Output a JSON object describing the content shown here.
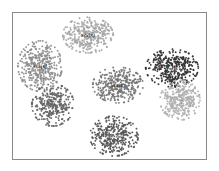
{
  "chart_data": {
    "type": "scatter",
    "title": "",
    "xlabel": "",
    "ylabel": "",
    "grid": false,
    "legend": null,
    "frame": {
      "x": 12,
      "y": 12,
      "width": 195,
      "height": 148,
      "border_color": "#8a8a8a"
    },
    "clusters": [
      {
        "id": "top-center",
        "label": "x(x|s)",
        "label_uncertain": true,
        "cx": 88,
        "cy": 35,
        "rx": 24,
        "ry": 17,
        "color": "#b3b3b3",
        "n": 320,
        "label_dx": 0,
        "label_dy": 0
      },
      {
        "id": "upper-left",
        "label": "x(x|s)",
        "label_uncertain": true,
        "cx": 40,
        "cy": 66,
        "rx": 21,
        "ry": 24,
        "color": "#999999",
        "n": 360,
        "label_dx": 0,
        "label_dy": 0
      },
      {
        "id": "lower-left",
        "label": "?",
        "label_uncertain": true,
        "cx": 53,
        "cy": 105,
        "rx": 20,
        "ry": 20,
        "color": "#6e6e6e",
        "n": 300,
        "label_dx": 2,
        "label_dy": -4
      },
      {
        "id": "center",
        "label": "x(x|s)",
        "label_uncertain": true,
        "cx": 118,
        "cy": 85,
        "rx": 24,
        "ry": 17,
        "color": "#7f7f7f",
        "n": 320,
        "label_dx": 0,
        "label_dy": 0
      },
      {
        "id": "bottom-center",
        "label": "x(x|s)",
        "label_uncertain": true,
        "cx": 114,
        "cy": 136,
        "rx": 23,
        "ry": 19,
        "color": "#5e5e5e",
        "n": 320,
        "label_dx": 0,
        "label_dy": 0
      },
      {
        "id": "upper-right",
        "label": "x(x|s)",
        "label_uncertain": true,
        "cx": 172,
        "cy": 68,
        "rx": 25,
        "ry": 18,
        "color": "#3a3a3a",
        "n": 380,
        "label_dx": 0,
        "label_dy": 0
      },
      {
        "id": "lower-right",
        "label": "?",
        "label_uncertain": true,
        "cx": 180,
        "cy": 100,
        "rx": 19,
        "ry": 19,
        "color": "#bdbdbd",
        "n": 300,
        "label_dx": 2,
        "label_dy": 2
      }
    ]
  }
}
